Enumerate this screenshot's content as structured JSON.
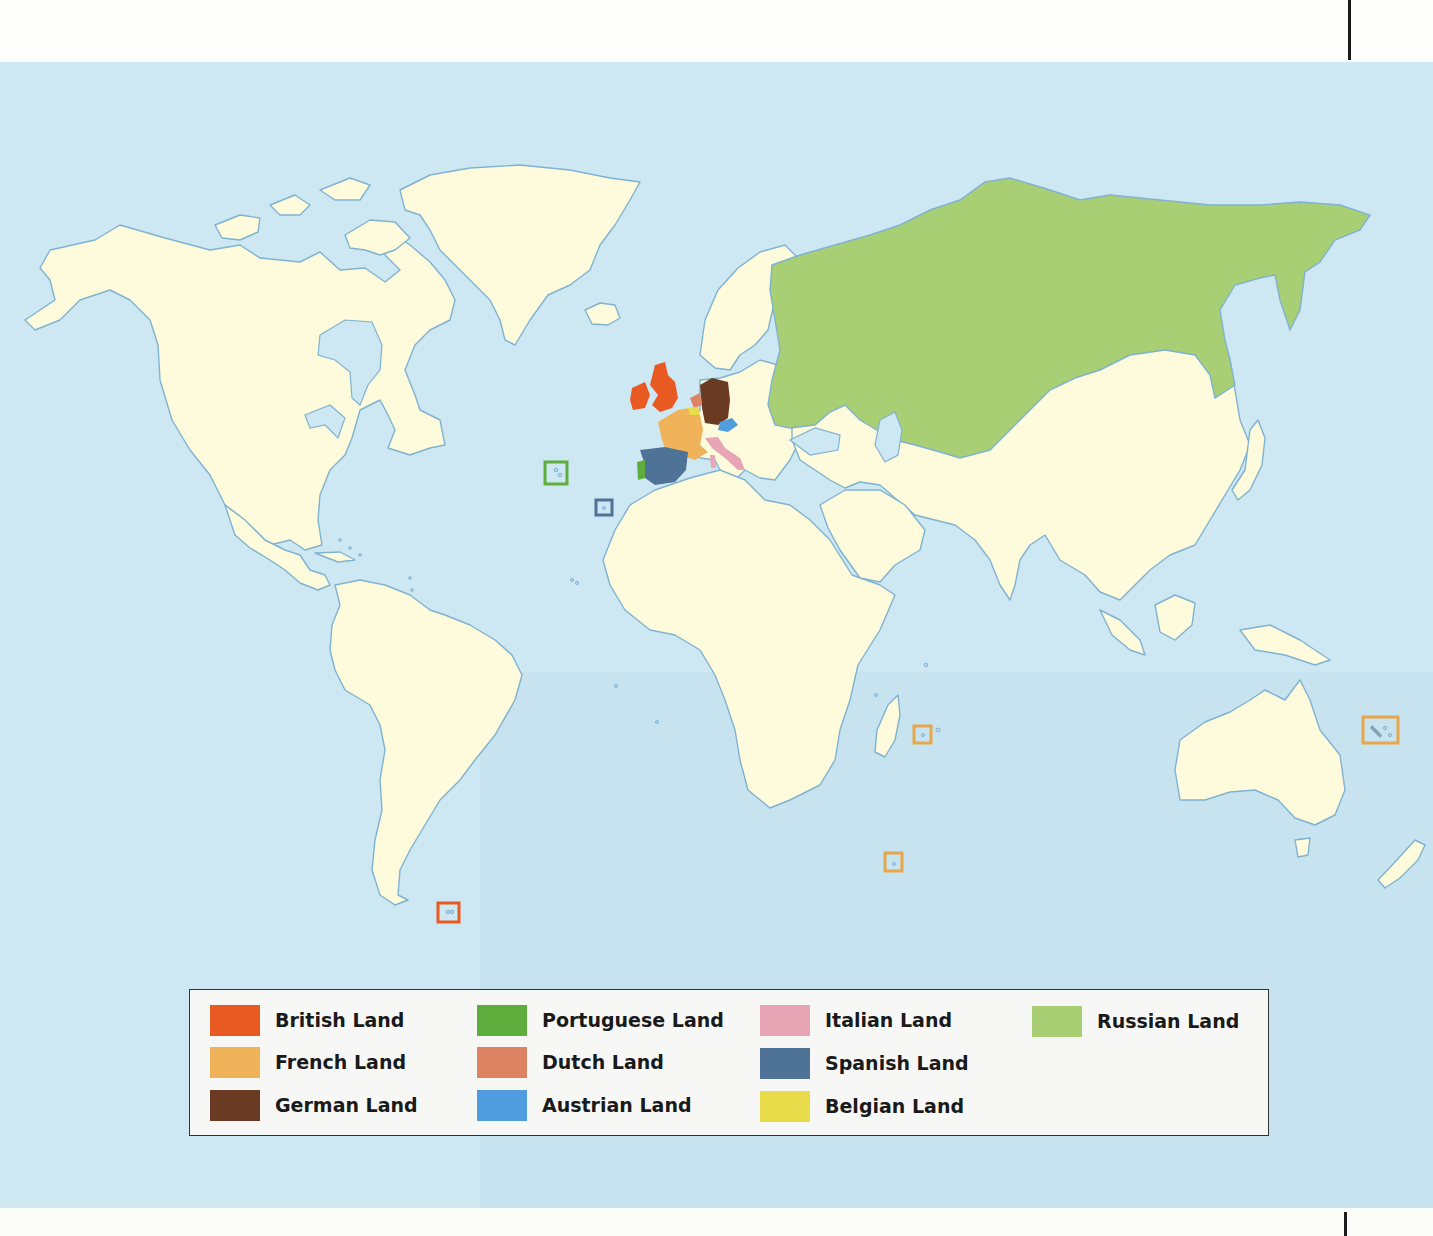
{
  "map": {
    "title": "",
    "ocean_color": "#cde8f3",
    "unclaimed_land_color": "#fdfbdc",
    "coastline_color": "#7fb2d0"
  },
  "legend": {
    "items": [
      {
        "key": "british",
        "label": "British Land",
        "color": "#e85a22",
        "col": 0,
        "row": 0
      },
      {
        "key": "french",
        "label": "French Land",
        "color": "#f0b35a",
        "col": 0,
        "row": 1
      },
      {
        "key": "german",
        "label": "German Land",
        "color": "#6a3b22",
        "col": 0,
        "row": 2
      },
      {
        "key": "portuguese",
        "label": "Portuguese Land",
        "color": "#5fae3d",
        "col": 1,
        "row": 0
      },
      {
        "key": "dutch",
        "label": "Dutch Land",
        "color": "#dd8262",
        "col": 1,
        "row": 1
      },
      {
        "key": "austrian",
        "label": "Austrian Land",
        "color": "#4f9ddf",
        "col": 1,
        "row": 2
      },
      {
        "key": "italian",
        "label": "Italian Land",
        "color": "#e8a5b5",
        "col": 2,
        "row": 0
      },
      {
        "key": "spanish",
        "label": "Spanish Land",
        "color": "#4f7396",
        "col": 2,
        "row": 1
      },
      {
        "key": "belgian",
        "label": "Belgian Land",
        "color": "#e8dc4a",
        "col": 2,
        "row": 2
      },
      {
        "key": "russian",
        "label": "Russian Land",
        "color": "#a9cf75",
        "col": 3,
        "row": 0
      }
    ]
  },
  "island_markers": [
    {
      "owner": "portuguese",
      "label": "Azores",
      "x": 545,
      "y": 462,
      "w": 22,
      "h": 22,
      "color": "#5fae3d"
    },
    {
      "owner": "spanish",
      "label": "Canary Islands",
      "x": 596,
      "y": 500,
      "w": 16,
      "h": 15,
      "color": "#4f7396"
    },
    {
      "owner": "british",
      "label": "Falkland Islands",
      "x": 438,
      "y": 903,
      "w": 21,
      "h": 19,
      "color": "#e85a22"
    },
    {
      "owner": "french",
      "label": "Reunion",
      "x": 914,
      "y": 726,
      "w": 17,
      "h": 17,
      "color": "#e8a64a"
    },
    {
      "owner": "french",
      "label": "Kerguelen",
      "x": 885,
      "y": 853,
      "w": 17,
      "h": 18,
      "color": "#e8a64a"
    },
    {
      "owner": "french",
      "label": "New Caledonia",
      "x": 1363,
      "y": 717,
      "w": 35,
      "h": 26,
      "color": "#e8a64a"
    }
  ]
}
